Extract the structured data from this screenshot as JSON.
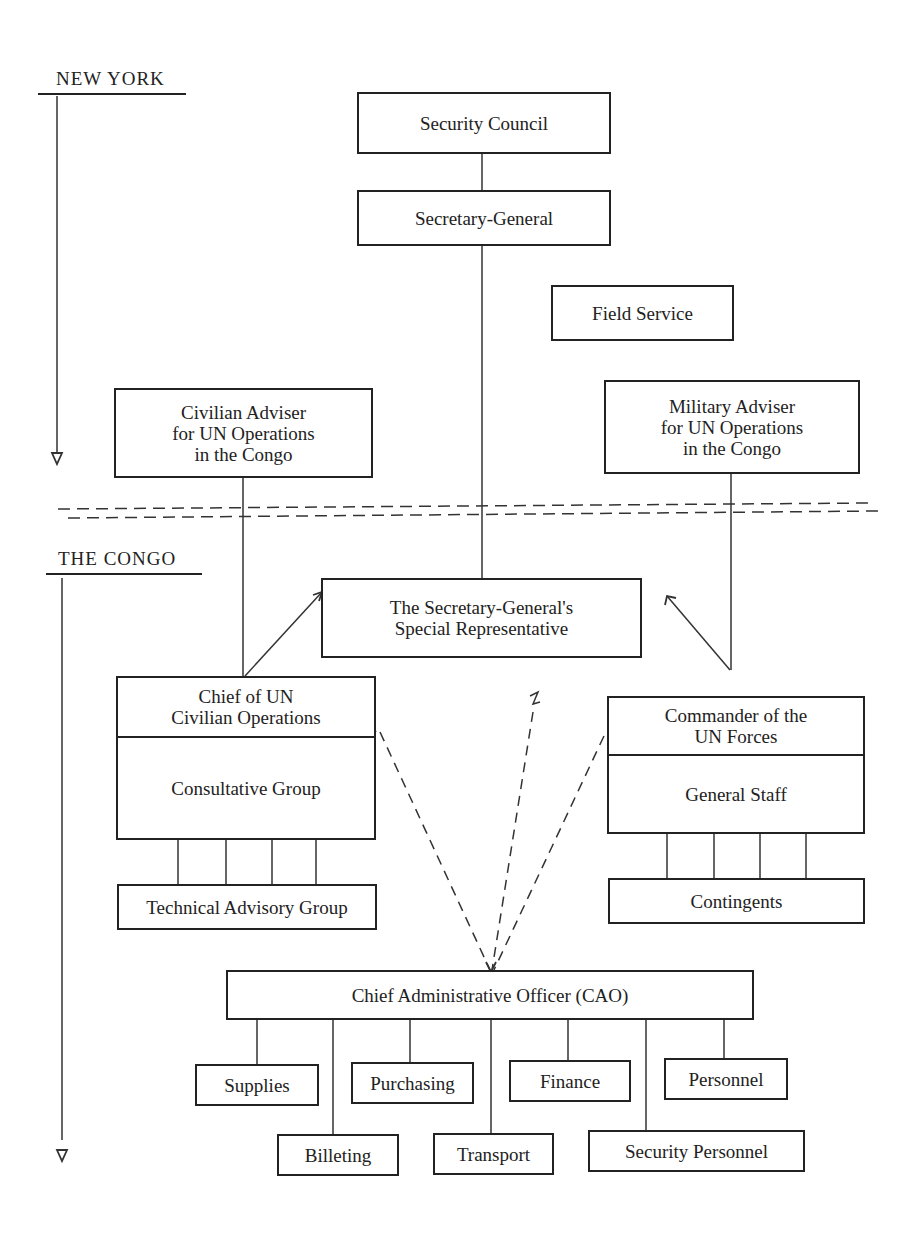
{
  "sections": {
    "new_york": "NEW YORK",
    "congo": "THE CONGO"
  },
  "nodes": {
    "security_council": "Security Council",
    "secretary_general": "Secretary-General",
    "field_service": "Field Service",
    "civilian_adviser": "Civilian Adviser\nfor UN Operations\nin the Congo",
    "military_adviser": "Military Adviser\nfor UN Operations\nin the Congo",
    "special_representative": "The Secretary-General's\nSpecial Representative",
    "chief_civilian_ops": "Chief of UN\nCivilian Operations",
    "consultative_group": "Consultative Group",
    "technical_advisory_group": "Technical Advisory Group",
    "commander_un_forces": "Commander of the\nUN Forces",
    "general_staff": "General Staff",
    "contingents": "Contingents",
    "cao": "Chief Administrative Officer (CAO)",
    "cao_units": {
      "supplies": "Supplies",
      "purchasing": "Purchasing",
      "finance": "Finance",
      "personnel": "Personnel",
      "billeting": "Billeting",
      "transport": "Transport",
      "security_personnel": "Security Personnel"
    }
  }
}
